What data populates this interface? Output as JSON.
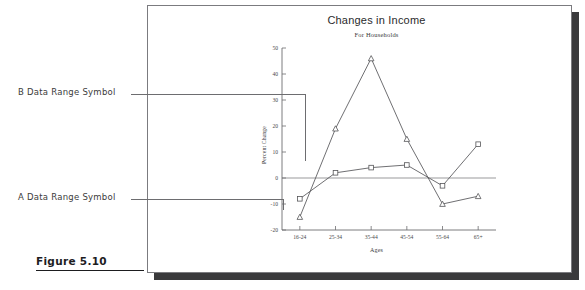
{
  "figure": {
    "caption": "Figure 5.10"
  },
  "annotations": [
    {
      "id": "b",
      "label": "B Data Range Symbol"
    },
    {
      "id": "a",
      "label": "A Data Range Symbol"
    }
  ],
  "chart_data": {
    "type": "line",
    "title": "Changes in Income",
    "subtitle": "For Households",
    "xlabel": "Ages",
    "ylabel": "Percent Change",
    "categories": [
      "16-24",
      "25-34",
      "35-44",
      "45-54",
      "55-64",
      "65+"
    ],
    "ylim": [
      -20,
      50
    ],
    "yticks": [
      -20,
      -10,
      0,
      10,
      20,
      30,
      40,
      50
    ],
    "ytick_labels": [
      "-20",
      "-10",
      "0",
      "10",
      "20",
      "30",
      "40",
      "50"
    ],
    "grid": false,
    "legend": "none",
    "series": [
      {
        "name": "B",
        "marker": "triangle",
        "color": "#555558",
        "values": [
          -15,
          19,
          46,
          15,
          -10,
          -7
        ]
      },
      {
        "name": "A",
        "marker": "square",
        "color": "#555558",
        "values": [
          -8,
          2,
          4,
          5,
          -3,
          13
        ]
      }
    ]
  }
}
